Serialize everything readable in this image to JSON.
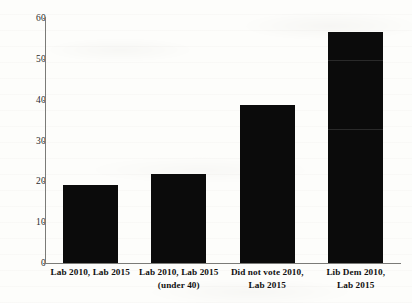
{
  "chart_data": {
    "type": "bar",
    "title": "",
    "subtitle": "",
    "xlabel": "",
    "ylabel": "",
    "ylim": [
      0,
      60
    ],
    "ytick_labels": [
      "0",
      "10",
      "20",
      "30",
      "40",
      "50",
      "60"
    ],
    "ytick_values": [
      0,
      10,
      20,
      30,
      40,
      50,
      60
    ],
    "grid": false,
    "legend": null,
    "bar_color": "#0b0b0b",
    "axis_color": "#7b7b78",
    "background_color": "#fdfdfb",
    "categories": [
      "Lab 2010, Lab 2015",
      "Lab 2010, Lab 2015 (under 40)",
      "Did not vote 2010, Lab 2015",
      "Lib Dem 2010, Lab 2015"
    ],
    "category_lines": [
      [
        "Lab 2010, Lab 2015"
      ],
      [
        "Lab 2010, Lab 2015",
        "(under 40)"
      ],
      [
        "Did not vote 2010,",
        "Lab 2015"
      ],
      [
        "Lib Dem 2010,",
        "Lab 2015"
      ]
    ],
    "values": [
      19,
      21.8,
      38.7,
      56.5
    ]
  }
}
